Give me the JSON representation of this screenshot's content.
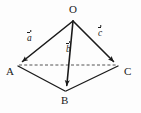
{
  "figure": {
    "kind": "geometry-diagram",
    "background_color": "#fdfdfd",
    "stroke_color": "#1a1a1a"
  },
  "vertices": [
    {
      "id": "O",
      "label": "O",
      "x": 73,
      "y": 20,
      "label_x": 70,
      "label_y": 6
    },
    {
      "id": "A",
      "label": "A",
      "x": 18,
      "y": 65,
      "label_x": 8,
      "label_y": 68
    },
    {
      "id": "B",
      "label": "B",
      "x": 66,
      "y": 91,
      "label_x": 62,
      "label_y": 97
    },
    {
      "id": "C",
      "label": "C",
      "x": 118,
      "y": 65,
      "label_x": 124,
      "label_y": 68
    }
  ],
  "vectors": [
    {
      "id": "a",
      "letter": "a",
      "from": "O",
      "to": "A",
      "x1": 73,
      "y1": 21,
      "x2": 19.5,
      "y2": 64,
      "label_x": 29,
      "label_y": 33
    },
    {
      "id": "b",
      "letter": "b",
      "from": "O",
      "to": "B",
      "x1": 73,
      "y1": 21,
      "x2": 66.5,
      "y2": 89,
      "label_x": 68,
      "label_y": 44
    },
    {
      "id": "c",
      "letter": "c",
      "from": "O",
      "to": "C",
      "x1": 73,
      "y1": 21,
      "x2": 116.5,
      "y2": 64,
      "label_x": 99,
      "label_y": 27
    }
  ],
  "edges": [
    {
      "id": "AB",
      "style": "solid",
      "x1": 18,
      "y1": 66,
      "x2": 65,
      "y2": 91
    },
    {
      "id": "BC",
      "style": "solid",
      "x1": 66,
      "y1": 91,
      "x2": 118,
      "y2": 66
    },
    {
      "id": "AC",
      "style": "dashed",
      "x1": 19,
      "y1": 65,
      "x2": 117,
      "y2": 65,
      "dash_pattern": "3,2.2"
    }
  ]
}
